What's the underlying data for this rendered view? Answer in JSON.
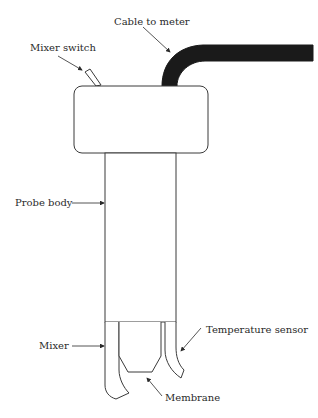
{
  "diagram": {
    "type": "labeled-schematic",
    "labels": {
      "cable": "Cable to meter",
      "mixer_switch": "Mixer switch",
      "probe_body": "Probe body",
      "mixer": "Mixer",
      "temperature_sensor": "Temperature sensor",
      "membrane": "Membrane"
    },
    "colors": {
      "stroke": "#3a3a3a",
      "cable_fill": "#1a1a1a",
      "background": "#ffffff",
      "text": "#2a2a2a"
    }
  }
}
